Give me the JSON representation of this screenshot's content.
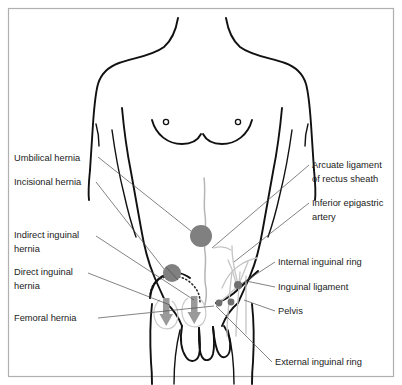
{
  "figure": {
    "background_color": "#ffffff",
    "border_color": "#b0b0b0",
    "outline_color": "#111111",
    "marker_color": "#808080",
    "arrow_color": "#9a9a9a",
    "leader_color": "#4d4d4d"
  },
  "labels_left": [
    {
      "id": "umbilical-hernia",
      "lines": [
        "Umbilical hernia"
      ],
      "x": 14,
      "y": 161
    },
    {
      "id": "incisional-hernia",
      "lines": [
        "Incisional hernia"
      ],
      "x": 14,
      "y": 185
    },
    {
      "id": "indirect-inguinal-hernia",
      "lines": [
        "Indirect inguinal",
        "hernia"
      ],
      "x": 14,
      "y": 238
    },
    {
      "id": "direct-inguinal-hernia",
      "lines": [
        "Direct inguinal",
        "hernia"
      ],
      "x": 14,
      "y": 275
    },
    {
      "id": "femoral-hernia",
      "lines": [
        "Femoral hernia"
      ],
      "x": 14,
      "y": 321
    }
  ],
  "labels_right": [
    {
      "id": "arcuate-ligament-of-rectus-sheath",
      "lines": [
        "Arcuate ligament",
        "of rectus sheath"
      ],
      "x": 312,
      "y": 168
    },
    {
      "id": "inferior-epigastric-artery",
      "lines": [
        "Inferior epigastric",
        "artery"
      ],
      "x": 312,
      "y": 206
    },
    {
      "id": "internal-inguinal-ring",
      "lines": [
        "Internal inguinal ring"
      ],
      "x": 278,
      "y": 265
    },
    {
      "id": "inguinal-ligament",
      "lines": [
        "Inguinal ligament"
      ],
      "x": 278,
      "y": 290
    },
    {
      "id": "pelvis",
      "lines": [
        "Pelvis"
      ],
      "x": 278,
      "y": 314
    }
  ],
  "labels_bottom": [
    {
      "id": "external-inguinal-ring",
      "lines": [
        "External inguinal ring"
      ],
      "x": 275,
      "y": 365
    }
  ],
  "markers": [
    {
      "id": "umbilical-hernia-marker",
      "cx": 201,
      "cy": 236,
      "r": 11
    },
    {
      "id": "incisional-hernia-marker",
      "cx": 172,
      "cy": 273,
      "r": 9
    },
    {
      "id": "internal-inguinal-ring-marker",
      "cx": 238,
      "cy": 285,
      "r": 4
    },
    {
      "id": "external-inguinal-ring-marker",
      "cx": 219,
      "cy": 303,
      "r": 3.4
    },
    {
      "id": "femoral-ring-marker",
      "cx": 231,
      "cy": 302,
      "r": 3.4
    }
  ]
}
